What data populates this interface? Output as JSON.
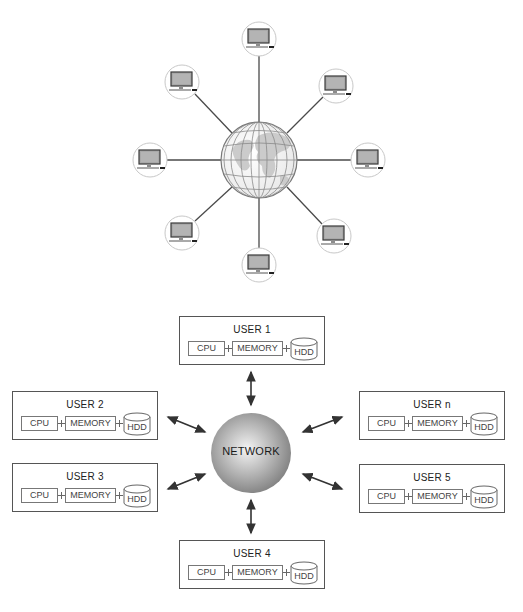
{
  "top_diagram": {
    "title": "",
    "center": {
      "type": "globe",
      "x": 259,
      "y": 160,
      "r": 38
    },
    "nodes": [
      {
        "id": "top",
        "icon": "monitor-icon",
        "x": 259,
        "y": 39
      },
      {
        "id": "top-right",
        "icon": "monitor-icon",
        "x": 336,
        "y": 86
      },
      {
        "id": "right",
        "icon": "monitor-icon",
        "x": 368,
        "y": 160
      },
      {
        "id": "bottom-right",
        "icon": "monitor-icon",
        "x": 334,
        "y": 236
      },
      {
        "id": "bottom",
        "icon": "monitor-icon",
        "x": 259,
        "y": 265
      },
      {
        "id": "bottom-left",
        "icon": "monitor-icon",
        "x": 182,
        "y": 233
      },
      {
        "id": "left",
        "icon": "monitor-icon",
        "x": 150,
        "y": 160
      },
      {
        "id": "top-left",
        "icon": "monitor-icon",
        "x": 182,
        "y": 82
      }
    ],
    "colors": {
      "line": "#555555",
      "node_border": "#c8c8c8",
      "screen": "#a9a9a9",
      "globe_land": "#c9c9c9"
    }
  },
  "bottom_diagram": {
    "network": {
      "label": "NETWORK",
      "x": 251,
      "y": 453,
      "r": 40,
      "color": "#9a9a9a"
    },
    "users": [
      {
        "title": "USER 1",
        "cpu": "CPU",
        "memory": "MEMORY",
        "hdd": "HDD",
        "x": 179,
        "y": 316
      },
      {
        "title": "USER 2",
        "cpu": "CPU",
        "memory": "MEMORY",
        "hdd": "HDD",
        "x": 12,
        "y": 391
      },
      {
        "title": "USER 3",
        "cpu": "CPU",
        "memory": "MEMORY",
        "hdd": "HDD",
        "x": 12,
        "y": 463
      },
      {
        "title": "USER 4",
        "cpu": "CPU",
        "memory": "MEMORY",
        "hdd": "HDD",
        "x": 179,
        "y": 540
      },
      {
        "title": "USER 5",
        "cpu": "CPU",
        "memory": "MEMORY",
        "hdd": "HDD",
        "x": 359,
        "y": 464
      },
      {
        "title": "USER n",
        "cpu": "CPU",
        "memory": "MEMORY",
        "hdd": "HDD",
        "x": 359,
        "y": 391
      }
    ],
    "arrows": "bidirectional"
  }
}
